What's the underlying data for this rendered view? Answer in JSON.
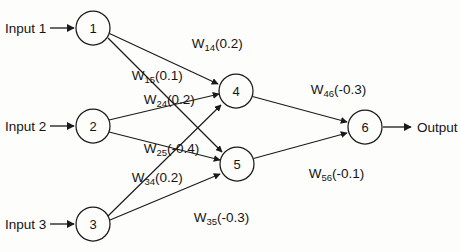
{
  "diagram": {
    "background_color": "#fdfdfc",
    "stroke_color": "#1a1a1a",
    "inputs": [
      {
        "label": "Input 1",
        "target_node": "1"
      },
      {
        "label": "Input 2",
        "target_node": "2"
      },
      {
        "label": "Input 3",
        "target_node": "3"
      }
    ],
    "output": {
      "label": "Output",
      "source_node": "6"
    },
    "nodes": [
      {
        "id": "1",
        "label": "1",
        "cx": 93,
        "cy": 28,
        "r": 17,
        "layer": "input"
      },
      {
        "id": "2",
        "label": "2",
        "cx": 93,
        "cy": 126,
        "r": 17,
        "layer": "input"
      },
      {
        "id": "3",
        "label": "3",
        "cx": 93,
        "cy": 224,
        "r": 17,
        "layer": "input"
      },
      {
        "id": "4",
        "label": "4",
        "cx": 236,
        "cy": 91,
        "r": 17,
        "layer": "hidden"
      },
      {
        "id": "5",
        "label": "5",
        "cx": 237,
        "cy": 164,
        "r": 17,
        "layer": "hidden"
      },
      {
        "id": "6",
        "label": "6",
        "cx": 365,
        "cy": 127,
        "r": 17,
        "layer": "output"
      }
    ],
    "edges": [
      {
        "from": "1",
        "to": "4",
        "weight_name": "W",
        "subscript": "14",
        "value": "(0.2)",
        "numeric": 0.2,
        "label": "W14(0.2)",
        "label_x": 158,
        "label_y": 48
      },
      {
        "from": "1",
        "to": "5",
        "weight_name": "W",
        "subscript": "15",
        "value": "(0.1)",
        "numeric": 0.1,
        "label": "W15(0.1)",
        "label_x": 98,
        "label_y": 80
      },
      {
        "from": "2",
        "to": "4",
        "weight_name": "W",
        "subscript": "24",
        "value": "(0.2)",
        "numeric": 0.2,
        "label": "W24(0.2)",
        "label_x": 110,
        "label_y": 104
      },
      {
        "from": "2",
        "to": "5",
        "weight_name": "W",
        "subscript": "25",
        "value": "(-0.4)",
        "numeric": -0.4,
        "label": "W25(-0.4)",
        "label_x": 110,
        "label_y": 153
      },
      {
        "from": "3",
        "to": "4",
        "weight_name": "W",
        "subscript": "34",
        "value": "(0.2)",
        "numeric": 0.2,
        "label": "W34(0.2)",
        "label_x": 98,
        "label_y": 182
      },
      {
        "from": "3",
        "to": "5",
        "weight_name": "W",
        "subscript": "35",
        "value": "(-0.3)",
        "numeric": -0.3,
        "label": "W35(-0.3)",
        "label_x": 160,
        "label_y": 222
      },
      {
        "from": "4",
        "to": "6",
        "weight_name": "W",
        "subscript": "46",
        "value": "(-0.3)",
        "numeric": -0.3,
        "label": "W46(-0.3)",
        "label_x": 277,
        "label_y": 94
      },
      {
        "from": "5",
        "to": "6",
        "weight_name": "W",
        "subscript": "56",
        "value": "(-0.1)",
        "numeric": -0.1,
        "label": "W56(-0.1)",
        "label_x": 275,
        "label_y": 178
      }
    ]
  }
}
